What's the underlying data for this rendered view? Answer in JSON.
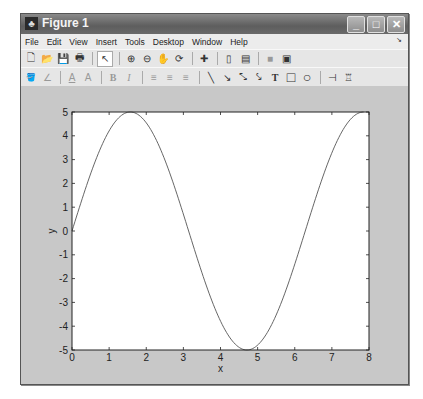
{
  "window": {
    "title": "Figure 1",
    "app_icon": "matlab-icon",
    "controls": {
      "minimize": "_",
      "maximize": "□",
      "close": "✕"
    }
  },
  "menubar": {
    "items": [
      "File",
      "Edit",
      "View",
      "Insert",
      "Tools",
      "Desktop",
      "Window",
      "Help"
    ],
    "dock_glyph": "↘"
  },
  "toolbar1": {
    "items": [
      {
        "name": "new-figure-icon",
        "glyph": "🗋"
      },
      {
        "name": "open-file-icon",
        "glyph": "📂"
      },
      {
        "name": "save-icon",
        "glyph": "💾"
      },
      {
        "name": "print-icon",
        "glyph": "🖶"
      },
      {
        "name": "edit-plot-arrow-icon",
        "glyph": "↖",
        "selected": true
      },
      {
        "name": "zoom-in-icon",
        "glyph": "⊕"
      },
      {
        "name": "zoom-out-icon",
        "glyph": "⊖"
      },
      {
        "name": "pan-hand-icon",
        "glyph": "✋"
      },
      {
        "name": "rotate-3d-icon",
        "glyph": "⟳"
      },
      {
        "name": "data-cursor-icon",
        "glyph": "✚"
      },
      {
        "name": "colorbar-icon",
        "glyph": "▯"
      },
      {
        "name": "legend-icon",
        "glyph": "▤"
      },
      {
        "name": "hide-plot-tools-icon",
        "glyph": "■"
      },
      {
        "name": "show-plot-tools-icon",
        "glyph": "▣"
      }
    ]
  },
  "toolbar2": {
    "items": [
      {
        "name": "face-color-icon",
        "glyph": "🪣"
      },
      {
        "name": "edge-color-icon",
        "glyph": "∠"
      },
      {
        "name": "text-color-icon",
        "glyph": "A"
      },
      {
        "name": "font-icon",
        "glyph": "A"
      },
      {
        "name": "bold-icon",
        "glyph": "B"
      },
      {
        "name": "italic-icon",
        "glyph": "I"
      },
      {
        "name": "align-left-icon",
        "glyph": "≡"
      },
      {
        "name": "align-center-icon",
        "glyph": "≡"
      },
      {
        "name": "align-right-icon",
        "glyph": "≡"
      },
      {
        "name": "line-icon",
        "glyph": "╲"
      },
      {
        "name": "arrow-icon",
        "glyph": "↘"
      },
      {
        "name": "double-arrow-icon",
        "glyph": "⤡"
      },
      {
        "name": "text-arrow-icon",
        "glyph": "⤥"
      },
      {
        "name": "text-box-icon",
        "glyph": "T"
      },
      {
        "name": "rectangle-icon",
        "glyph": "□"
      },
      {
        "name": "ellipse-icon",
        "glyph": "○"
      },
      {
        "name": "pin-icon",
        "glyph": "⊣"
      },
      {
        "name": "align-distribute-icon",
        "glyph": "♖"
      }
    ]
  },
  "chart_data": {
    "type": "line",
    "title": "",
    "xlabel": "x",
    "ylabel": "y",
    "xlim": [
      0,
      8
    ],
    "ylim": [
      -5,
      5
    ],
    "xticks": [
      "0",
      "1",
      "2",
      "3",
      "4",
      "5",
      "6",
      "7",
      "8"
    ],
    "yticks": [
      "-5",
      "-4",
      "-3",
      "-2",
      "-1",
      "0",
      "1",
      "2",
      "3",
      "4",
      "5"
    ],
    "grid": false,
    "legend": null,
    "series": [
      {
        "name": "y = 5 sin(x)",
        "color": "#555555",
        "x": [
          0,
          0.5,
          1.0,
          1.5708,
          2.0,
          2.5,
          3.1416,
          3.5,
          4.0,
          4.7124,
          5.0,
          5.5,
          6.2832,
          6.5,
          7.0,
          7.854
        ],
        "y": [
          0,
          2.4,
          4.21,
          5.0,
          4.55,
          2.99,
          0.0,
          -1.75,
          -3.78,
          -5.0,
          -4.79,
          -3.53,
          0.0,
          1.08,
          3.28,
          5.0
        ]
      }
    ]
  }
}
